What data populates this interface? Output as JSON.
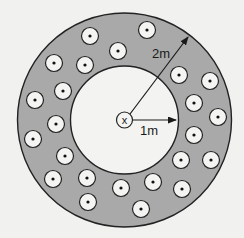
{
  "diagram": {
    "colors": {
      "background": "#f1f1ef",
      "annulus_fill": "#a9a9a9",
      "inner_fill": "#f3f3f1",
      "stroke": "#222222",
      "wire_fill": "#f4f4f2",
      "wire_dot": "#111111"
    },
    "center": {
      "x": 124.5,
      "y": 120
    },
    "outer_radius": 107,
    "inner_radius": 54,
    "center_wire": {
      "symbol": "x",
      "meaning": "current into page",
      "radius": 8
    },
    "wire_radius": 8.5,
    "wire_symbol": "dot (current out of page)",
    "wires": [
      {
        "x": 90,
        "y": 36
      },
      {
        "x": 147,
        "y": 30
      },
      {
        "x": 118,
        "y": 51
      },
      {
        "x": 54,
        "y": 63
      },
      {
        "x": 85,
        "y": 65
      },
      {
        "x": 63,
        "y": 91
      },
      {
        "x": 35,
        "y": 100
      },
      {
        "x": 56,
        "y": 124
      },
      {
        "x": 33,
        "y": 139
      },
      {
        "x": 65,
        "y": 156
      },
      {
        "x": 53,
        "y": 179
      },
      {
        "x": 87,
        "y": 178
      },
      {
        "x": 88,
        "y": 202
      },
      {
        "x": 121,
        "y": 188
      },
      {
        "x": 141,
        "y": 209
      },
      {
        "x": 153,
        "y": 182
      },
      {
        "x": 182,
        "y": 189
      },
      {
        "x": 181,
        "y": 160
      },
      {
        "x": 211,
        "y": 160
      },
      {
        "x": 194,
        "y": 135
      },
      {
        "x": 218,
        "y": 117
      },
      {
        "x": 194,
        "y": 103
      },
      {
        "x": 179,
        "y": 75
      },
      {
        "x": 210,
        "y": 81
      }
    ],
    "arrows": [
      {
        "name": "outer-radius-arrow",
        "x1": 130,
        "y1": 114,
        "x2": 188,
        "y2": 37,
        "label": "2m",
        "label_x": 152,
        "label_y": 58
      },
      {
        "name": "inner-radius-arrow",
        "x1": 133,
        "y1": 120,
        "x2": 176,
        "y2": 120,
        "label": "1m",
        "label_x": 140,
        "label_y": 135
      }
    ]
  }
}
